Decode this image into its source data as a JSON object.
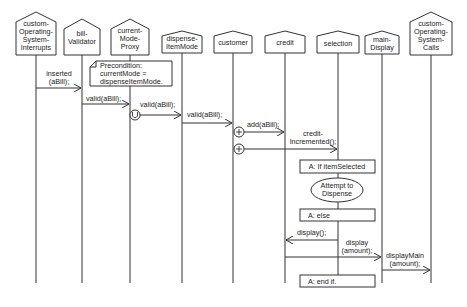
{
  "diagram": {
    "type": "sequence",
    "lifelines": [
      {
        "id": "custom-os-interrupts",
        "lines": [
          "custom-",
          "Operating-",
          "System-",
          "Interrupts"
        ]
      },
      {
        "id": "bill-validator",
        "lines": [
          "bill-",
          "Validator"
        ]
      },
      {
        "id": "current-mode-proxy",
        "lines": [
          "current-",
          "Mode-",
          "Proxy"
        ]
      },
      {
        "id": "dispense-item-mode",
        "lines": [
          "dispense-",
          "ItemMode"
        ]
      },
      {
        "id": "customer",
        "lines": [
          "customer"
        ]
      },
      {
        "id": "credit",
        "lines": [
          "credit"
        ]
      },
      {
        "id": "selection",
        "lines": [
          "selection"
        ]
      },
      {
        "id": "main-display",
        "lines": [
          "main-",
          "Display"
        ]
      },
      {
        "id": "custom-os-calls",
        "lines": [
          "custom-",
          "Operating-",
          "System-",
          "Calls"
        ]
      }
    ],
    "note": {
      "lines": [
        "Precondition:",
        "currentMode =",
        "dispenseItemMode."
      ]
    },
    "messages": [
      {
        "from": "custom-os-interrupts",
        "to": "bill-validator",
        "lines": [
          "inserted",
          "(aBill);"
        ]
      },
      {
        "from": "bill-validator",
        "to": "current-mode-proxy",
        "lines": [
          "valid(aBill);"
        ]
      },
      {
        "from": "current-mode-proxy",
        "to": "dispense-item-mode",
        "lines": [
          "valid(aBill);"
        ],
        "marker": "U"
      },
      {
        "from": "dispense-item-mode",
        "to": "customer",
        "lines": [
          "valid(aBill);"
        ]
      },
      {
        "from": "customer",
        "to": "credit",
        "lines": [
          "add(aBill);"
        ],
        "marker": "+"
      },
      {
        "from": "customer",
        "to": "selection",
        "lines": [
          "credit-",
          "Incremented();"
        ],
        "marker": "+"
      },
      {
        "from": "selection",
        "to": "credit",
        "lines": [
          "display();"
        ]
      },
      {
        "from": "credit",
        "to": "main-display",
        "lines": [
          "display",
          "(amount);"
        ]
      },
      {
        "from": "main-display",
        "to": "custom-os-calls",
        "lines": [
          "displayMain",
          "(amount);"
        ]
      }
    ],
    "fragments": [
      {
        "kind": "box",
        "label": "A: If itemSelected"
      },
      {
        "kind": "ellipse",
        "lines": [
          "Attempt to",
          "Dispense"
        ]
      },
      {
        "kind": "box",
        "label": "A: else"
      },
      {
        "kind": "box",
        "label": "A: end if."
      }
    ]
  }
}
